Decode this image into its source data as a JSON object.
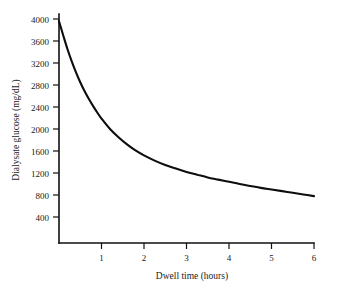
{
  "chart_data": {
    "type": "line",
    "title": "",
    "xlabel": "Dwell time (hours)",
    "ylabel": "Dialysate glucose (mg/dL)",
    "xlim": [
      0,
      6
    ],
    "ylim": [
      0,
      4200
    ],
    "grid": false,
    "legend": null,
    "xticks": [
      1,
      2,
      3,
      4,
      5,
      6
    ],
    "xtick_labels": [
      "1",
      "2",
      "3",
      "4",
      "5",
      "6"
    ],
    "yticks": [
      400,
      800,
      1200,
      1600,
      2000,
      2400,
      2800,
      3200,
      3600,
      4000
    ],
    "ytick_labels": [
      "400",
      "800",
      "1200",
      "1600",
      "2000",
      "2400",
      "2800",
      "3200",
      "3600",
      "4000"
    ],
    "series": [
      {
        "name": "Dialysate glucose decay",
        "color": "#0d0d0d",
        "x": [
          0.0,
          0.1,
          0.2,
          0.3,
          0.4,
          0.5,
          0.6,
          0.7,
          0.8,
          0.9,
          1.0,
          1.2,
          1.4,
          1.6,
          1.8,
          2.0,
          2.25,
          2.5,
          2.75,
          3.0,
          3.25,
          3.5,
          3.75,
          4.0,
          4.25,
          4.5,
          4.75,
          5.0,
          5.25,
          5.5,
          5.75,
          6.0
        ],
        "y": [
          3960,
          3700,
          3450,
          3230,
          3030,
          2850,
          2690,
          2550,
          2420,
          2300,
          2190,
          2000,
          1850,
          1720,
          1610,
          1520,
          1425,
          1345,
          1280,
          1220,
          1170,
          1120,
          1080,
          1040,
          1000,
          965,
          930,
          900,
          870,
          840,
          810,
          780
        ]
      }
    ]
  },
  "axes": {
    "y_axis_name": "dialysate-glucose-axis",
    "x_axis_name": "dwell-time-axis"
  }
}
